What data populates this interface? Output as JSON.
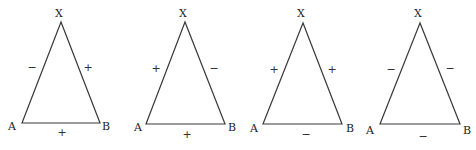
{
  "diagram": {
    "colors": {
      "line": "#3a3a3a",
      "text": "#222222",
      "background": "#ffffff"
    },
    "triangles": [
      {
        "id": "triangle-1",
        "vertices": {
          "X": {
            "label": "X",
            "x": 61,
            "y": 22,
            "label_x": 59,
            "label_y": 17
          },
          "A": {
            "label": "A",
            "x": 22,
            "y": 123,
            "label_x": 12,
            "label_y": 130
          },
          "B": {
            "label": "B",
            "x": 100,
            "y": 123,
            "label_x": 106,
            "label_y": 130
          }
        },
        "edges": {
          "XA": {
            "sign": "−",
            "x": 32,
            "y": 71
          },
          "XB": {
            "sign": "+",
            "x": 88,
            "y": 71
          },
          "AB": {
            "sign": "+",
            "x": 62,
            "y": 136
          }
        }
      },
      {
        "id": "triangle-2",
        "vertices": {
          "X": {
            "label": "X",
            "x": 185,
            "y": 22,
            "label_x": 183,
            "label_y": 17
          },
          "A": {
            "label": "A",
            "x": 146,
            "y": 124,
            "label_x": 138,
            "label_y": 131
          },
          "B": {
            "label": "B",
            "x": 225,
            "y": 124,
            "label_x": 232,
            "label_y": 131
          },
          "_": null
        },
        "edges": {
          "XA": {
            "sign": "+",
            "x": 156,
            "y": 72
          },
          "XB": {
            "sign": "−",
            "x": 214,
            "y": 72
          },
          "AB": {
            "sign": "+",
            "x": 187,
            "y": 138
          }
        }
      },
      {
        "id": "triangle-3",
        "vertices": {
          "X": {
            "label": "X",
            "x": 303,
            "y": 23,
            "label_x": 301,
            "label_y": 17
          },
          "A": {
            "label": "A",
            "x": 263,
            "y": 124,
            "label_x": 254,
            "label_y": 132
          },
          "B": {
            "label": "B",
            "x": 342,
            "y": 124,
            "label_x": 350,
            "label_y": 132
          }
        },
        "edges": {
          "XA": {
            "sign": "+",
            "x": 274,
            "y": 73
          },
          "XB": {
            "sign": "+",
            "x": 332,
            "y": 73
          },
          "AB": {
            "sign": "−",
            "x": 306,
            "y": 138
          }
        }
      },
      {
        "id": "triangle-4",
        "vertices": {
          "X": {
            "label": "X",
            "x": 420,
            "y": 23,
            "label_x": 418,
            "label_y": 17
          },
          "A": {
            "label": "A",
            "x": 380,
            "y": 124,
            "label_x": 370,
            "label_y": 134
          },
          "B": {
            "label": "B",
            "x": 460,
            "y": 124,
            "label_x": 467,
            "label_y": 134
          }
        },
        "edges": {
          "XA": {
            "sign": "−",
            "x": 391,
            "y": 73
          },
          "XB": {
            "sign": "−",
            "x": 450,
            "y": 72
          },
          "AB": {
            "sign": "−",
            "x": 423,
            "y": 140
          }
        }
      }
    ]
  }
}
